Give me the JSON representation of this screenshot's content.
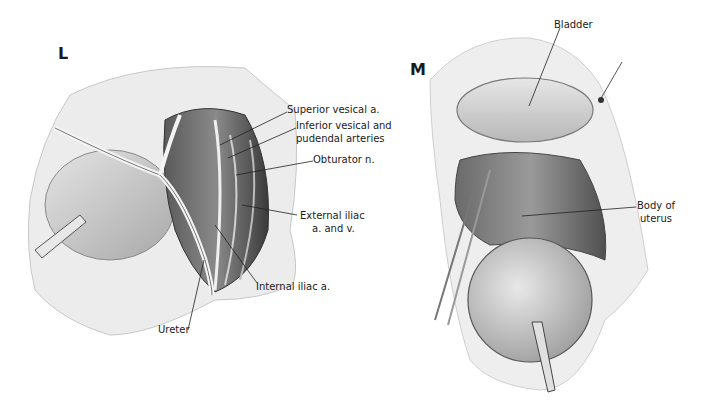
{
  "figure": {
    "panels": [
      {
        "id": "L",
        "letter": "L",
        "labels": {
          "superior_vesical": "Superior vesical a.",
          "inferior_vesical_1": "Inferior vesical and",
          "inferior_vesical_2": "pudendal arteries",
          "obturator": "Obturator n.",
          "external_iliac_1": "External iliac",
          "external_iliac_2": "a. and v.",
          "internal_iliac": "Internal iliac a.",
          "ureter": "Ureter"
        }
      },
      {
        "id": "M",
        "letter": "M",
        "labels": {
          "bladder": "Bladder",
          "body_of_uterus_1": "Body of",
          "body_of_uterus_2": "uterus"
        }
      }
    ],
    "colors": {
      "background": "#ffffff",
      "tissue_light": "#d9d9d9",
      "tissue_mid": "#9a9a9a",
      "tissue_dark": "#4a4a4a",
      "leader_line": "#222222"
    }
  }
}
